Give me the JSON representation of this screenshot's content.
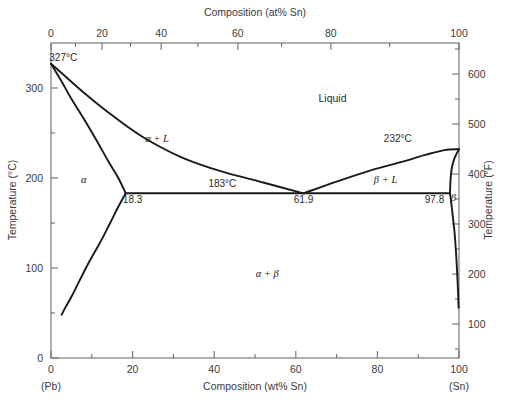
{
  "figure": {
    "title_top": "Composition (at% Sn)",
    "title_bottom": "Composition (wt% Sn)",
    "title_left": "Temperature (°C)",
    "title_right": "Temperature (°F)",
    "left_endpoint": "(Pb)",
    "right_endpoint": "(Sn)",
    "line_color": "#1a1a1a",
    "axis_color": "#6e6e6e",
    "background": "#ffffff"
  },
  "chart_data": {
    "type": "line",
    "xlabel": "Composition (wt% Sn)",
    "ylabel": "Temperature (°C)",
    "xlabel_top": "Composition (at% Sn)",
    "ylabel_right": "Temperature (°F)",
    "xlim": [
      0,
      100
    ],
    "ylim": [
      0,
      350
    ],
    "ylim_right": [
      32,
      662
    ],
    "grid": false,
    "legend": null,
    "x_ticks_bottom": [
      0,
      20,
      40,
      60,
      80,
      100
    ],
    "x_tick_labels_bottom": [
      "0",
      "20",
      "40",
      "60",
      "80",
      "100"
    ],
    "x_minor_ticks_bottom": [
      10,
      30,
      50,
      70,
      90
    ],
    "x_ticks_top_at_pct": [
      0,
      20,
      40,
      60,
      80,
      100
    ],
    "x_tick_labels_top": [
      "0",
      "20",
      "40",
      "60",
      "80",
      "100"
    ],
    "x_ticks_top_wtpct_positions": [
      0.0,
      12.5,
      27.0,
      45.8,
      68.6,
      100.0
    ],
    "x_minor_ticks_top_wtpct_positions": [
      6.0,
      19.5,
      36.0,
      56.5,
      83.0
    ],
    "y_ticks_left": [
      0,
      100,
      200,
      300
    ],
    "y_tick_labels_left": [
      "0",
      "100",
      "200",
      "300"
    ],
    "y_minor_ticks_left": [
      50,
      150,
      250
    ],
    "y_ticks_right_F": [
      100,
      200,
      300,
      400,
      500,
      600
    ],
    "y_tick_labels_right": [
      "100",
      "200",
      "300",
      "400",
      "500",
      "600"
    ],
    "y_minor_ticks_right_F": [
      50,
      150,
      250,
      350,
      450,
      550,
      650
    ],
    "invariant": {
      "name": "eutectic",
      "temperature_C": 183,
      "temperature_label": "183°C",
      "composition_wt_pct_Sn": 61.9,
      "alpha_limit_wt_pct_Sn": 18.3,
      "beta_limit_wt_pct_Sn": 97.8
    },
    "melting_points": [
      {
        "element": "Pb",
        "composition_wt_pct_Sn": 0,
        "temperature_C": 327,
        "label": "327°C"
      },
      {
        "element": "Sn",
        "composition_wt_pct_Sn": 100,
        "temperature_C": 232,
        "label": "232°C"
      }
    ],
    "series": [
      {
        "name": "liquidus (Pb-rich side)",
        "points": [
          [
            0,
            327
          ],
          [
            3,
            315
          ],
          [
            8,
            295
          ],
          [
            14,
            273
          ],
          [
            22,
            247
          ],
          [
            32,
            223
          ],
          [
            42,
            207
          ],
          [
            52,
            195
          ],
          [
            61.9,
            183
          ]
        ]
      },
      {
        "name": "solidus (alpha)",
        "points": [
          [
            0,
            327
          ],
          [
            2.5,
            308
          ],
          [
            5,
            288
          ],
          [
            8,
            266
          ],
          [
            11,
            243
          ],
          [
            14,
            219
          ],
          [
            16.5,
            200
          ],
          [
            18.3,
            183
          ]
        ]
      },
      {
        "name": "solvus (alpha)",
        "points": [
          [
            18.3,
            183
          ],
          [
            16.5,
            168
          ],
          [
            14.5,
            150
          ],
          [
            12,
            128
          ],
          [
            9.5,
            108
          ],
          [
            7,
            86
          ],
          [
            5,
            68
          ],
          [
            3.5,
            56
          ],
          [
            2.6,
            48
          ]
        ]
      },
      {
        "name": "liquidus (Sn-rich side)",
        "points": [
          [
            61.9,
            183
          ],
          [
            70,
            196
          ],
          [
            78,
            208
          ],
          [
            86,
            218
          ],
          [
            92,
            226
          ],
          [
            96.5,
            231
          ],
          [
            100,
            232
          ]
        ]
      },
      {
        "name": "solidus (beta)",
        "points": [
          [
            100,
            232
          ],
          [
            98.9,
            222
          ],
          [
            98.2,
            210
          ],
          [
            97.9,
            196
          ],
          [
            97.8,
            183
          ]
        ]
      },
      {
        "name": "solvus (beta)",
        "points": [
          [
            97.8,
            183
          ],
          [
            98.3,
            165
          ],
          [
            98.9,
            140
          ],
          [
            99.3,
            115
          ],
          [
            99.6,
            90
          ],
          [
            99.8,
            70
          ],
          [
            99.9,
            56
          ]
        ]
      }
    ],
    "region_labels": [
      {
        "text": "Liquid",
        "composition_wt_pct_Sn": 69,
        "temperature_C": 285,
        "style": "plain"
      },
      {
        "text": "α",
        "composition_wt_pct_Sn": 8,
        "temperature_C": 195,
        "style": "italic"
      },
      {
        "text": "β",
        "composition_wt_pct_Sn": 98.6,
        "temperature_C": 175,
        "style": "italic"
      },
      {
        "text": "α + L",
        "composition_wt_pct_Sn": 26,
        "temperature_C": 240,
        "style": "italic"
      },
      {
        "text": "β + L",
        "composition_wt_pct_Sn": 82,
        "temperature_C": 195,
        "style": "italic"
      },
      {
        "text": "α + β",
        "composition_wt_pct_Sn": 53,
        "temperature_C": 90,
        "style": "italic"
      }
    ],
    "annotations": [
      {
        "text": "327°C",
        "composition_wt_pct_Sn": 3,
        "temperature_C": 330
      },
      {
        "text": "232°C",
        "composition_wt_pct_Sn": 85,
        "temperature_C": 240
      },
      {
        "text": "183°C",
        "composition_wt_pct_Sn": 42,
        "temperature_C": 190
      },
      {
        "text": "18.3",
        "composition_wt_pct_Sn": 20,
        "temperature_C": 172
      },
      {
        "text": "61.9",
        "composition_wt_pct_Sn": 61.9,
        "temperature_C": 172
      },
      {
        "text": "97.8",
        "composition_wt_pct_Sn": 94,
        "temperature_C": 172
      }
    ]
  }
}
